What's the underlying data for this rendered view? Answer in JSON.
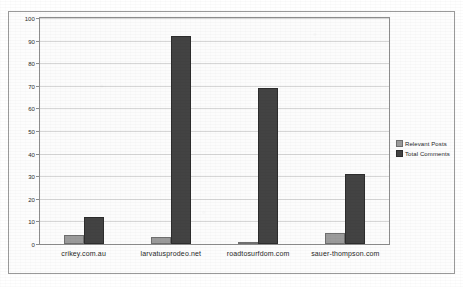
{
  "chart_data": {
    "type": "bar",
    "title": "",
    "subtitle": "",
    "xlabel": "",
    "ylabel": "",
    "categories": [
      "crikey.com.au",
      "larvatusprodeo.net",
      "roadtosurfdom.com",
      "sauer-thompson.com"
    ],
    "series": [
      {
        "name": "Relevant Posts",
        "color": "#9b9b9b",
        "values": [
          4,
          3,
          1,
          5
        ]
      },
      {
        "name": "Total Comments",
        "color": "#434343",
        "values": [
          12,
          92,
          69,
          31
        ]
      }
    ],
    "ylim": [
      0,
      100
    ],
    "ytick_labels": [
      "0",
      "10",
      "20",
      "30",
      "40",
      "50",
      "60",
      "70",
      "80",
      "90",
      "100"
    ],
    "ytick_values": [
      0,
      10,
      20,
      30,
      40,
      50,
      60,
      70,
      80,
      90,
      100
    ],
    "grid": true,
    "grid_axis": "y",
    "legend_position": "right",
    "bar_orientation": "vertical",
    "grouping": "grouped"
  },
  "legend": {
    "items": [
      {
        "label": "Relevant Posts"
      },
      {
        "label": "Total Comments"
      }
    ]
  },
  "colors": {
    "series_relevant_posts": "#9b9b9b",
    "series_total_comments": "#434343",
    "gridline": "#d6d6d6",
    "axis": "#8d8d8d",
    "frame": "#9a9a9a",
    "plot_background": "#fcfcfc"
  }
}
